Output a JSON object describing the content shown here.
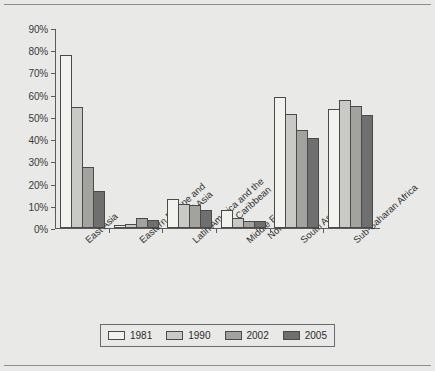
{
  "chart_data": {
    "type": "bar",
    "title": "",
    "xlabel": "",
    "ylabel": "",
    "ylim": [
      0,
      90
    ],
    "ytick_step": 10,
    "ytick_labels": [
      "90%",
      "80%",
      "70%",
      "60%",
      "50%",
      "40%",
      "30%",
      "20%",
      "10%",
      "0%"
    ],
    "ytick_values": [
      90,
      80,
      70,
      60,
      50,
      40,
      30,
      20,
      10,
      0
    ],
    "grid": false,
    "legend_position": "bottom",
    "categories": [
      "East Asia",
      "Eastern Europe and Central Asia",
      "Latin America and the Caribbean",
      "Middle East and North Africa",
      "South Asia",
      "Sub-Saharan Africa"
    ],
    "category_lines": [
      [
        "East Asia"
      ],
      [
        "Eastern Europe and",
        "Central Asia"
      ],
      [
        "Latin America and the",
        "Caribbean"
      ],
      [
        "Middle East and",
        "North Africa"
      ],
      [
        "South Asia"
      ],
      [
        "Sub-Saharan Africa"
      ]
    ],
    "series": [
      {
        "name": "1981",
        "color": "#f2f2ee",
        "values": [
          78.0,
          1.5,
          13.0,
          8.0,
          59.0,
          53.5
        ]
      },
      {
        "name": "1990",
        "color": "#c9c9c5",
        "values": [
          54.5,
          2.0,
          11.0,
          4.5,
          51.5,
          57.5
        ]
      },
      {
        "name": "2002",
        "color": "#a2a29e",
        "values": [
          27.5,
          4.5,
          10.5,
          3.2,
          44.0,
          55.0
        ]
      },
      {
        "name": "2005",
        "color": "#6f6f6f",
        "values": [
          16.5,
          3.5,
          8.0,
          3.3,
          40.5,
          51.0
        ]
      }
    ]
  },
  "legend": {
    "items": [
      {
        "label": "1981",
        "color": "#f2f2ee"
      },
      {
        "label": "1990",
        "color": "#c9c9c5"
      },
      {
        "label": "2002",
        "color": "#a2a29e"
      },
      {
        "label": "2005",
        "color": "#6f6f6f"
      }
    ]
  },
  "colors": {
    "page_background": "#e9e9e7",
    "axis": "#5b5b5b",
    "bar_outline": "#4a4a4a",
    "rule": "#8e8e8e"
  }
}
